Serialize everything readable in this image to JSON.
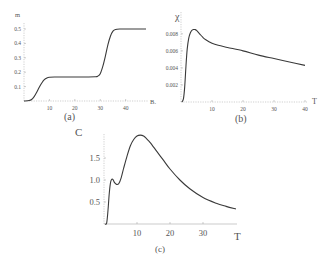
{
  "chart_data": [
    {
      "id": "a",
      "type": "line",
      "caption": "(a)",
      "xlabel": "Bₓ",
      "ylabel": "m",
      "xlim": [
        0,
        48
      ],
      "ylim": [
        0,
        0.5
      ],
      "xticks": [
        10,
        20,
        30,
        40
      ],
      "yticks": [
        0.1,
        0.2,
        0.3,
        0.4,
        0.5
      ],
      "ytick_labels": [
        "0.1",
        "0.2",
        "0.3",
        "0.4",
        "0.5"
      ],
      "grid": false,
      "x": [
        0,
        2,
        3,
        4,
        5,
        6,
        7,
        8,
        9,
        10,
        12,
        15,
        20,
        25,
        28,
        29,
        30,
        31,
        32,
        33,
        34,
        35,
        36,
        38,
        40,
        45,
        48
      ],
      "y": [
        0.0,
        0.003,
        0.01,
        0.03,
        0.06,
        0.095,
        0.125,
        0.148,
        0.16,
        0.165,
        0.167,
        0.167,
        0.167,
        0.167,
        0.168,
        0.172,
        0.19,
        0.24,
        0.31,
        0.39,
        0.45,
        0.485,
        0.497,
        0.5,
        0.5,
        0.5,
        0.5
      ]
    },
    {
      "id": "b",
      "type": "line",
      "caption": "(b)",
      "xlabel": "T",
      "ylabel": "χ",
      "xlim": [
        0,
        40
      ],
      "ylim": [
        0,
        0.0088
      ],
      "xticks": [
        10,
        20,
        30,
        40
      ],
      "yticks": [
        0.002,
        0.004,
        0.006,
        0.008
      ],
      "ytick_labels": [
        "0.002",
        "0.004",
        "0.006",
        "0.008"
      ],
      "grid": false,
      "x": [
        0.3,
        0.8,
        1.2,
        1.6,
        2.0,
        2.5,
        3.0,
        3.5,
        4.0,
        4.5,
        5.0,
        6.0,
        7.0,
        8.0,
        10.0,
        12.0,
        15.0,
        20.0,
        25.0,
        30.0,
        35.0,
        40.0
      ],
      "y": [
        0.0,
        0.0004,
        0.0018,
        0.0042,
        0.0062,
        0.0075,
        0.0081,
        0.0084,
        0.0085,
        0.0085,
        0.0084,
        0.008,
        0.0076,
        0.0073,
        0.0069,
        0.00665,
        0.0064,
        0.006,
        0.0055,
        0.0051,
        0.0047,
        0.0043
      ]
    },
    {
      "id": "c",
      "type": "line",
      "caption": "(c)",
      "xlabel": "T",
      "ylabel": "C",
      "xlim": [
        0,
        40
      ],
      "ylim": [
        0,
        2.0
      ],
      "xticks": [
        10,
        20,
        30
      ],
      "yticks": [
        0.5,
        1.0,
        1.5
      ],
      "ytick_labels": [
        "0.5",
        "1.0",
        "1.5"
      ],
      "grid": false,
      "x": [
        0.3,
        0.8,
        1.2,
        1.6,
        2.0,
        2.4,
        2.8,
        3.2,
        3.8,
        4.5,
        5.2,
        6.0,
        7.0,
        8.0,
        9.0,
        10.0,
        11.0,
        12.0,
        13.0,
        14.0,
        16.0,
        18.0,
        20.0,
        23.0,
        26.0,
        30.0,
        34.0,
        37.0,
        40.0
      ],
      "y": [
        0.0,
        0.02,
        0.3,
        0.7,
        0.95,
        1.02,
        1.0,
        0.94,
        0.9,
        0.92,
        1.05,
        1.28,
        1.55,
        1.78,
        1.92,
        2.0,
        2.02,
        2.0,
        1.93,
        1.85,
        1.65,
        1.45,
        1.25,
        1.0,
        0.8,
        0.6,
        0.47,
        0.4,
        0.34
      ]
    }
  ],
  "figure": {
    "panels": [
      {
        "caption": "(a)"
      },
      {
        "caption": "(b)"
      },
      {
        "caption": "(c)"
      }
    ]
  }
}
